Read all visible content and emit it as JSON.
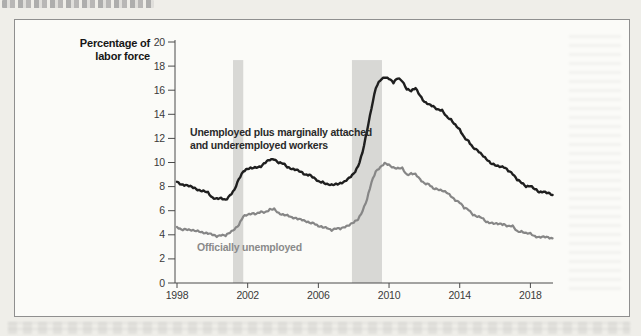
{
  "figure": {
    "y_axis_title": {
      "line1": "Percentage of",
      "line2": "labor force"
    },
    "annotations": {
      "series1_line1": "Unemployed plus marginally attached",
      "series1_line2": "and underemployed workers",
      "series2": "Officially unemployed"
    }
  },
  "chart_data": {
    "type": "line",
    "title": "",
    "xlabel": "",
    "ylabel": "Percentage of labor force",
    "xlim": [
      1998,
      2019.3
    ],
    "ylim": [
      0,
      20
    ],
    "yticks": [
      0,
      2,
      4,
      6,
      8,
      10,
      12,
      14,
      16,
      18,
      20
    ],
    "xticks": [
      1998,
      2002,
      2006,
      2010,
      2014,
      2018
    ],
    "grid": false,
    "legend_position": "inline-annotations",
    "colors": {
      "series1": "#1f1f1f",
      "series2": "#868686",
      "recession_band": "#d8d8d5",
      "axis": "#4a4a4a",
      "tick_label": "#3a3a3a"
    },
    "recession_bands": [
      {
        "start": 2001.17,
        "end": 2001.75
      },
      {
        "start": 2007.9,
        "end": 2009.6
      }
    ],
    "band_top_value": 18.5,
    "series": [
      {
        "name": "Unemployed plus marginally attached and underemployed workers",
        "color": "#1f1f1f",
        "width": 2.4,
        "x_start": 1998.0,
        "x_step": 0.25,
        "values": [
          8.4,
          8.2,
          8.1,
          8.0,
          7.9,
          7.7,
          7.6,
          7.5,
          7.1,
          7.0,
          7.0,
          6.9,
          7.3,
          7.7,
          8.6,
          9.3,
          9.5,
          9.5,
          9.6,
          9.7,
          10.0,
          10.2,
          10.3,
          10.0,
          9.9,
          9.6,
          9.5,
          9.4,
          9.2,
          9.0,
          9.0,
          8.7,
          8.4,
          8.4,
          8.2,
          8.1,
          8.2,
          8.3,
          8.4,
          8.7,
          9.1,
          9.7,
          10.8,
          12.6,
          14.5,
          16.2,
          16.8,
          17.1,
          17.0,
          16.6,
          17.0,
          16.8,
          16.1,
          15.9,
          16.2,
          15.6,
          15.0,
          14.8,
          14.7,
          14.4,
          14.3,
          13.8,
          13.6,
          13.1,
          12.7,
          12.1,
          11.8,
          11.2,
          11.0,
          10.7,
          10.3,
          9.9,
          9.8,
          9.7,
          9.6,
          9.3,
          9.1,
          8.6,
          8.3,
          8.0,
          8.1,
          7.8,
          7.5,
          7.6,
          7.5,
          7.3
        ]
      },
      {
        "name": "Officially unemployed",
        "color": "#868686",
        "width": 2.2,
        "x_start": 1998.0,
        "x_step": 0.25,
        "values": [
          4.6,
          4.4,
          4.5,
          4.4,
          4.3,
          4.3,
          4.2,
          4.1,
          4.0,
          3.9,
          4.0,
          3.9,
          4.2,
          4.5,
          4.8,
          5.5,
          5.7,
          5.8,
          5.7,
          5.9,
          5.9,
          6.1,
          6.1,
          5.8,
          5.7,
          5.6,
          5.4,
          5.4,
          5.3,
          5.1,
          5.0,
          5.0,
          4.7,
          4.6,
          4.6,
          4.4,
          4.5,
          4.5,
          4.7,
          4.8,
          5.0,
          5.3,
          6.0,
          6.9,
          8.3,
          9.3,
          9.6,
          9.9,
          9.8,
          9.6,
          9.5,
          9.5,
          9.0,
          9.1,
          9.0,
          8.6,
          8.3,
          8.2,
          7.8,
          7.8,
          7.7,
          7.5,
          7.2,
          6.9,
          6.7,
          6.2,
          6.1,
          5.7,
          5.5,
          5.4,
          5.1,
          5.0,
          4.9,
          4.9,
          4.9,
          4.7,
          4.7,
          4.3,
          4.3,
          4.1,
          4.1,
          3.9,
          3.8,
          3.8,
          3.8,
          3.7
        ]
      }
    ]
  }
}
